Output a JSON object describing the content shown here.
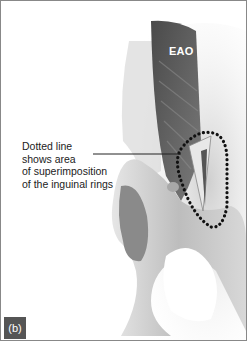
{
  "figure": {
    "muscle_label": "EAO",
    "annotation_lines": [
      "Dotted line",
      "shows area",
      "of superimposition",
      "of the inguinal rings"
    ],
    "panel_label": "(b)",
    "colors": {
      "muscle": "#5a5a5a",
      "bone": "#c8c8c8",
      "outline_dots": "#111111",
      "panel_label_bg": "#555555"
    }
  }
}
